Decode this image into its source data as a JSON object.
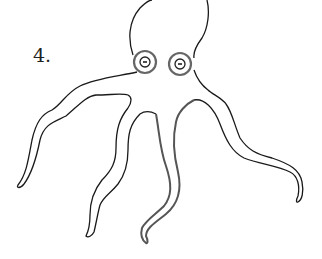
{
  "figure": {
    "label": "4.",
    "colors": {
      "background": "#ffffff",
      "outline": "#1a1a1a",
      "eye_ring": "#666666",
      "thick_tentacle": "#555555"
    },
    "parts": [
      "head",
      "left-eye",
      "right-eye",
      "tentacle-far-left",
      "tentacle-mid-left",
      "tentacle-center",
      "tentacle-right"
    ]
  }
}
